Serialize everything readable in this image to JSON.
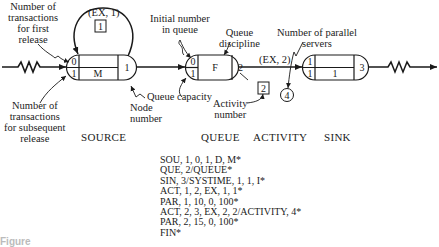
{
  "diagram": {
    "type": "network-simulation-flow",
    "nodes": {
      "source": {
        "section_label": "SOURCE",
        "first_release": "0",
        "subsequent_release": "1",
        "queue_discipline": "M",
        "node_number": "1"
      },
      "queue": {
        "section_label": "QUEUE",
        "initial_number": "0",
        "capacity": "1",
        "queue_discipline": "F",
        "node_number": "2"
      },
      "activity": {
        "section_label": "ACTIVITY",
        "edge_label": "(EX, 2)",
        "activity_number": "2",
        "parallel_servers": "4"
      },
      "sink": {
        "section_label": "SINK",
        "top_left": "1",
        "bottom_left": "1",
        "middle": "1",
        "node_number": "3"
      },
      "source_loop": {
        "edge_label": "(EX, 1)",
        "activity_number": "1"
      }
    },
    "annotations": {
      "first_release": [
        "Number of",
        "transactions",
        "for first",
        "release"
      ],
      "subsequent_release": [
        "Number of",
        "transactions",
        "for subsequent",
        "release"
      ],
      "node_number": [
        "Node",
        "number"
      ],
      "initial_in_queue": [
        "Initial number",
        "in queue"
      ],
      "queue_discipline": [
        "Queue",
        "discipline"
      ],
      "queue_capacity": "Queue capacity",
      "activity_number": [
        "Activity",
        "number"
      ],
      "parallel_servers": [
        "Number of parallel",
        "servers"
      ]
    },
    "code_lines": [
      "SOU, 1, 0, 1, D, M*",
      "QUE, 2/QUEUE*",
      "SIN, 3/SYSTIME, 1, 1, I*",
      "ACT, 1, 2, EX, 1, 1*",
      "PAR, 1, 10, 0, 100*",
      "ACT, 2, 3, EX, 2, 2/ACTIVITY, 4*",
      "PAR, 2, 15, 0, 100*",
      "FIN*"
    ],
    "caption": "Figure"
  }
}
